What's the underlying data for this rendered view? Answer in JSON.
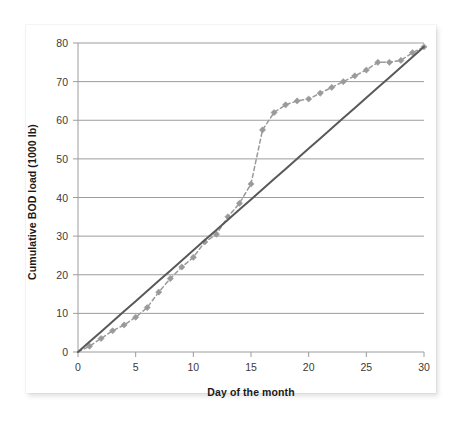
{
  "chart_data": {
    "type": "line",
    "title": "",
    "xlabel": "Day of the month",
    "ylabel": "Cumulative BOD load (1000 lb)",
    "xlim": [
      0,
      30
    ],
    "ylim": [
      0,
      80
    ],
    "xticks": [
      0,
      5,
      10,
      15,
      20,
      25,
      30
    ],
    "yticks": [
      0,
      10,
      20,
      30,
      40,
      50,
      60,
      70,
      80
    ],
    "grid": "horizontal",
    "legend": "none",
    "x": [
      0,
      1,
      2,
      3,
      4,
      5,
      6,
      7,
      8,
      9,
      10,
      11,
      12,
      13,
      14,
      15,
      16,
      17,
      18,
      19,
      20,
      21,
      22,
      23,
      24,
      25,
      26,
      27,
      28,
      29,
      30
    ],
    "series": [
      {
        "name": "Cumulative BOD load",
        "style": "dashed-line-with-diamond-markers",
        "color": "#9a9a9a",
        "values": [
          0,
          1.5,
          3.5,
          5.5,
          7.0,
          9.0,
          11.5,
          15.5,
          19.0,
          22.0,
          24.5,
          28.5,
          30.5,
          35.0,
          38.5,
          43.5,
          57.5,
          62.0,
          64.0,
          65.0,
          65.5,
          67.0,
          68.5,
          70.0,
          71.5,
          73.0,
          75.0,
          75.0,
          75.5,
          77.5,
          79.0
        ]
      },
      {
        "name": "Average (reference) line",
        "style": "solid-line",
        "color": "#595959",
        "values": [
          0,
          2.633,
          5.267,
          7.9,
          10.533,
          13.167,
          15.8,
          18.433,
          21.067,
          23.7,
          26.333,
          28.967,
          31.6,
          34.233,
          36.867,
          39.5,
          42.133,
          44.767,
          47.4,
          50.033,
          52.667,
          55.3,
          57.933,
          60.567,
          63.2,
          65.833,
          68.467,
          71.1,
          73.733,
          76.367,
          79.0
        ]
      }
    ]
  },
  "axis": {
    "y_title": "Cumulative BOD load (1000 lb)",
    "x_title": "Day of the month",
    "y_tick_labels": [
      "80",
      "70",
      "60",
      "50",
      "40",
      "30",
      "20",
      "10",
      "0"
    ],
    "x_tick_labels": [
      "0",
      "5",
      "10",
      "15",
      "20",
      "25",
      "30"
    ]
  },
  "colors": {
    "grid": "#9c9c9c",
    "axis": "#9c9c9c",
    "data_series": "#9a9a9a",
    "reference_line": "#595959",
    "background": "#ffffff",
    "text": "#1a1a1a"
  }
}
